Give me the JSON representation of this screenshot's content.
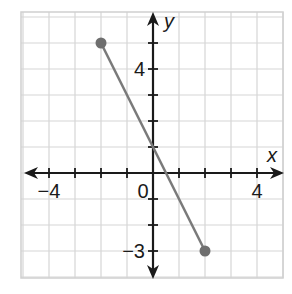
{
  "chart_data": {
    "type": "line",
    "title": "",
    "xlabel": "x",
    "ylabel": "y",
    "xlim": [
      -5,
      5
    ],
    "ylim": [
      -4,
      6
    ],
    "grid": true,
    "x_tick_labels": [
      {
        "value": -4,
        "label": "−4"
      },
      {
        "value": 0,
        "label": "0"
      },
      {
        "value": 4,
        "label": "4"
      }
    ],
    "y_tick_labels": [
      {
        "value": 4,
        "label": "4"
      },
      {
        "value": -3,
        "label": "−3"
      }
    ],
    "series": [
      {
        "name": "segment",
        "x": [
          -2,
          2
        ],
        "y": [
          5,
          -3
        ],
        "color": "#7a7a7a",
        "endpoints": "closed-dots"
      }
    ],
    "colors": {
      "grid": "#d6d6d6",
      "axis": "#1a1a1a",
      "line": "#7a7a7a",
      "point": "#6e6e6e"
    }
  }
}
